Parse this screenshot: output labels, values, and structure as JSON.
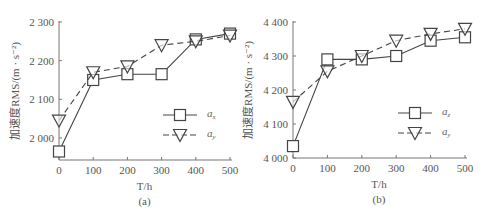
{
  "chart_data": [
    {
      "type": "line",
      "panel_label": "(a)",
      "xlabel": "T/h",
      "ylabel": "加速度RMS/(m · s⁻²)",
      "x": [
        0,
        100,
        200,
        300,
        400,
        500
      ],
      "x_ticks": [
        "0",
        "100",
        "200",
        "300",
        "400",
        "500"
      ],
      "y_ticks": [
        "2 000",
        "2 100",
        "2 200",
        "2 300"
      ],
      "y_tick_values": [
        2000,
        2100,
        2200,
        2300
      ],
      "xlim": [
        0,
        500
      ],
      "ylim": [
        1943,
        2300
      ],
      "legend_position": "center-right",
      "series": [
        {
          "name": "a_x",
          "legend": "a",
          "legend_sub": "x",
          "marker": "square",
          "linestyle": "solid",
          "values": [
            1965,
            2150,
            2165,
            2165,
            2255,
            2270
          ]
        },
        {
          "name": "a_y",
          "legend": "a",
          "legend_sub": "y",
          "marker": "triangle-down",
          "linestyle": "dashed",
          "values": [
            2045,
            2170,
            2185,
            2240,
            2250,
            2265
          ]
        }
      ]
    },
    {
      "type": "line",
      "panel_label": "(b)",
      "xlabel": "T/h",
      "ylabel": "加速度RMS/(m · s⁻²)",
      "x": [
        0,
        100,
        200,
        300,
        400,
        500
      ],
      "x_ticks": [
        "0",
        "100",
        "200",
        "300",
        "400",
        "500"
      ],
      "y_ticks": [
        "4 000",
        "4 100",
        "4 200",
        "4 300",
        "4 400"
      ],
      "y_tick_values": [
        4000,
        4100,
        4200,
        4300,
        4400
      ],
      "xlim": [
        0,
        500
      ],
      "ylim": [
        4000,
        4400
      ],
      "legend_position": "center-right",
      "series": [
        {
          "name": "a_z",
          "legend": "a",
          "legend_sub": "z",
          "marker": "square",
          "linestyle": "solid",
          "values": [
            4035,
            4290,
            4290,
            4300,
            4345,
            4355
          ]
        },
        {
          "name": "a_y",
          "legend": "a",
          "legend_sub": "y",
          "marker": "triangle-down",
          "linestyle": "dashed",
          "values": [
            4165,
            4255,
            4300,
            4345,
            4365,
            4380
          ]
        }
      ]
    }
  ]
}
